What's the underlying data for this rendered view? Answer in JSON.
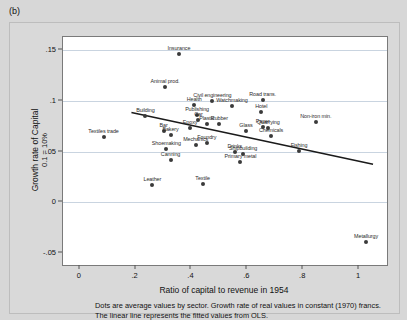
{
  "panel_label": "(b)",
  "chart_data": {
    "type": "scatter",
    "title": "",
    "xlabel": "Ratio of capital to revenue in 1954",
    "ylabel": "Growth rate of Capital",
    "ylabel_sub": "0.1 = 10%",
    "xlim": [
      -0.06,
      1.1
    ],
    "ylim": [
      -0.062,
      0.163
    ],
    "xticks": [
      0,
      0.2,
      0.4,
      0.6,
      0.8,
      1
    ],
    "xtick_labels": [
      "0",
      ".2",
      ".4",
      ".6",
      ".8",
      "1"
    ],
    "yticks": [
      -0.05,
      0,
      0.05,
      0.1,
      0.15
    ],
    "ytick_labels": [
      "-.05",
      "0",
      ".05",
      ".1",
      ".15"
    ],
    "gridlines_y": [
      0.15,
      0.1,
      0.05,
      0
    ],
    "grid": true,
    "legend": "none",
    "points": [
      {
        "label": "Insurance",
        "x": 0.355,
        "y": 0.1465
      },
      {
        "label": "Animal prod.",
        "x": 0.305,
        "y": 0.1135
      },
      {
        "label": "Civil engineering",
        "x": 0.475,
        "y": 0.0995
      },
      {
        "label": "Road trans.",
        "x": 0.655,
        "y": 0.1005
      },
      {
        "label": "Health",
        "x": 0.41,
        "y": 0.0955
      },
      {
        "label": "Watchmaking",
        "x": 0.545,
        "y": 0.0945
      },
      {
        "label": "Hotel",
        "x": 0.65,
        "y": 0.0885
      },
      {
        "label": "Publishing",
        "x": 0.42,
        "y": 0.0865
      },
      {
        "label": "Building",
        "x": 0.235,
        "y": 0.0855
      },
      {
        "label": "Car",
        "x": 0.425,
        "y": 0.0815
      },
      {
        "label": "Plastic",
        "x": 0.455,
        "y": 0.0775
      },
      {
        "label": "Rubber",
        "x": 0.5,
        "y": 0.0775
      },
      {
        "label": "Non-iron min.",
        "x": 0.845,
        "y": 0.0795
      },
      {
        "label": "Paper",
        "x": 0.655,
        "y": 0.0745
      },
      {
        "label": "Quarrying",
        "x": 0.675,
        "y": 0.0735
      },
      {
        "label": "Glass",
        "x": 0.595,
        "y": 0.0705
      },
      {
        "label": "Epoxy",
        "x": 0.395,
        "y": 0.0735
      },
      {
        "label": "Bar",
        "x": 0.3,
        "y": 0.0705
      },
      {
        "label": "Chemicals",
        "x": 0.685,
        "y": 0.0655
      },
      {
        "label": "Bakery",
        "x": 0.325,
        "y": 0.0665
      },
      {
        "label": "Textiles trade",
        "x": 0.085,
        "y": 0.0645
      },
      {
        "label": "Foundry",
        "x": 0.455,
        "y": 0.0585
      },
      {
        "label": "Mechanics",
        "x": 0.415,
        "y": 0.0565
      },
      {
        "label": "Shoemaking",
        "x": 0.31,
        "y": 0.0525
      },
      {
        "label": "Fishing",
        "x": 0.785,
        "y": 0.0505
      },
      {
        "label": "Drinks",
        "x": 0.555,
        "y": 0.0495
      },
      {
        "label": "Shipbuilding",
        "x": 0.585,
        "y": 0.0475
      },
      {
        "label": "Primary metal",
        "x": 0.575,
        "y": 0.0395
      },
      {
        "label": "Canning",
        "x": 0.325,
        "y": 0.0415
      },
      {
        "label": "Leather",
        "x": 0.26,
        "y": 0.017
      },
      {
        "label": "Textile",
        "x": 0.44,
        "y": 0.018
      },
      {
        "label": "Metallurgy",
        "x": 1.025,
        "y": -0.0395
      }
    ],
    "fit_line": {
      "name": "OLS fitted values",
      "x0": 0.185,
      "y0": 0.0885,
      "x1": 1.05,
      "y1": 0.0375
    }
  },
  "caption": {
    "line1": "Dots are average values by sector. Growth rate of real values in constant (1970) francs.",
    "line2": "The linear line represents the fitted values from OLS."
  }
}
